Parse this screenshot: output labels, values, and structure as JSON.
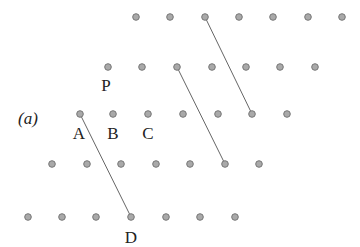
{
  "diagram": {
    "panel_label": "(a)",
    "colors": {
      "dot_fill": "#a9a9a9",
      "dot_stroke": "#777777",
      "line": "#666666",
      "text": "#222222"
    },
    "rows": [
      {
        "y": 17,
        "x": [
          136,
          170,
          205,
          239,
          273,
          308,
          342
        ]
      },
      {
        "y": 67,
        "x": [
          108,
          142,
          177,
          212,
          246,
          280,
          315
        ]
      },
      {
        "y": 114,
        "x": [
          80,
          113,
          148,
          183,
          218,
          252,
          287
        ]
      },
      {
        "y": 164,
        "x": [
          52,
          87,
          121,
          156,
          190,
          225,
          259
        ]
      },
      {
        "y": 217,
        "x": [
          28,
          62,
          96,
          131,
          166,
          200,
          235
        ]
      }
    ],
    "lines": [
      {
        "x1": 205,
        "y1": 17,
        "x2": 252,
        "y2": 114
      },
      {
        "x1": 177,
        "y1": 67,
        "x2": 225,
        "y2": 164
      },
      {
        "x1": 80,
        "y1": 114,
        "x2": 131,
        "y2": 217
      }
    ],
    "labels": [
      {
        "text": "(a)",
        "x": 28,
        "y": 124,
        "italic": true,
        "name": "panel-label"
      },
      {
        "text": "P",
        "x": 106,
        "y": 91,
        "italic": false,
        "name": "label-p"
      },
      {
        "text": "A",
        "x": 79,
        "y": 139,
        "italic": false,
        "name": "label-a"
      },
      {
        "text": "B",
        "x": 113,
        "y": 139,
        "italic": false,
        "name": "label-b"
      },
      {
        "text": "C",
        "x": 148,
        "y": 139,
        "italic": false,
        "name": "label-c"
      },
      {
        "text": "D",
        "x": 131,
        "y": 243,
        "italic": false,
        "name": "label-d"
      }
    ]
  }
}
